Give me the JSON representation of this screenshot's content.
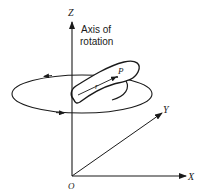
{
  "diagram": {
    "axes": {
      "z_label": "Z",
      "x_label": "X",
      "y_label": "Y",
      "origin_label": "O"
    },
    "annotation": {
      "line1": "Axis of",
      "line2": "rotation"
    },
    "body": {
      "point_label": "P",
      "radius_label": "r"
    },
    "colors": {
      "stroke": "#1a1a1a",
      "background": "#ffffff"
    }
  }
}
